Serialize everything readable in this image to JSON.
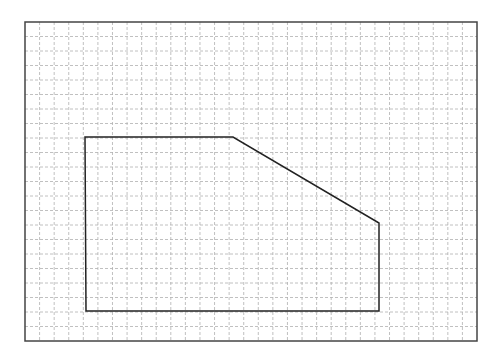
{
  "diagram": {
    "type": "grid-polygon",
    "background": "#ffffff",
    "frame": {
      "x": 25,
      "y": 22,
      "width": 452,
      "height": 319,
      "stroke": "#444444"
    },
    "grid": {
      "cols": 31,
      "rows": 22,
      "stroke": "#b0b0b0",
      "dash": "3,2"
    },
    "polygon": {
      "stroke": "#222222",
      "points": [
        [
          85,
          137
        ],
        [
          233,
          137
        ],
        [
          379,
          223
        ],
        [
          379,
          311
        ],
        [
          86,
          311
        ]
      ]
    }
  }
}
